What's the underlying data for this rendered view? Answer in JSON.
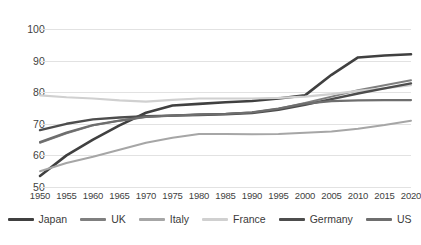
{
  "chart_data": {
    "type": "line",
    "title": "",
    "subtitle": "",
    "xlabel": "",
    "ylabel": "",
    "xlim": [
      1950,
      2020
    ],
    "ylim": [
      50,
      100
    ],
    "yticks": [
      50,
      60,
      70,
      80,
      90,
      100
    ],
    "grid": true,
    "legend_position": "bottom",
    "categories": [
      1950,
      1955,
      1960,
      1965,
      1970,
      1975,
      1980,
      1985,
      1990,
      1995,
      2000,
      2005,
      2010,
      2015,
      2020
    ],
    "xtick_labels": [
      "1950",
      "1955",
      "1960",
      "1965",
      "1970",
      "1975",
      "1980",
      "1985",
      "1990",
      "1995",
      "2000",
      "2005",
      "2010",
      "2015",
      "2020"
    ],
    "ytick_labels": [
      "50",
      "60",
      "70",
      "80",
      "90",
      "100"
    ],
    "series": [
      {
        "name": "Japan",
        "color": "#404040",
        "width": 2.6,
        "values": [
          53.5,
          60.0,
          65.0,
          69.5,
          73.5,
          75.8,
          76.3,
          76.8,
          77.2,
          78.0,
          79.0,
          85.5,
          91.0,
          91.6,
          92.0
        ]
      },
      {
        "name": "UK",
        "color": "#7f7f7f",
        "width": 2.0,
        "values": [
          64.0,
          67.0,
          69.5,
          71.0,
          72.2,
          72.6,
          73.0,
          73.2,
          73.6,
          74.8,
          76.6,
          78.6,
          80.6,
          82.2,
          83.8
        ]
      },
      {
        "name": "Italy",
        "color": "#a6a6a6",
        "width": 2.0,
        "values": [
          55.0,
          57.6,
          59.6,
          61.8,
          64.0,
          65.6,
          66.8,
          66.8,
          66.7,
          66.8,
          67.2,
          67.6,
          68.4,
          69.6,
          71.0
        ]
      },
      {
        "name": "France",
        "color": "#d0d0d0",
        "width": 2.2,
        "values": [
          79.0,
          78.4,
          78.0,
          77.4,
          77.0,
          77.6,
          78.0,
          78.0,
          78.0,
          78.2,
          78.6,
          79.4,
          80.4,
          81.2,
          82.2
        ]
      },
      {
        "name": "Germany",
        "color": "#4d4d4d",
        "width": 2.4,
        "values": [
          68.0,
          70.0,
          71.4,
          72.0,
          72.4,
          72.6,
          72.8,
          73.0,
          73.4,
          74.4,
          76.0,
          77.8,
          79.6,
          81.2,
          82.8
        ]
      },
      {
        "name": "US",
        "color": "#6e6e6e",
        "width": 2.2,
        "values": [
          64.2,
          67.2,
          69.6,
          71.0,
          72.2,
          72.6,
          72.9,
          73.1,
          73.6,
          74.8,
          76.4,
          77.2,
          77.4,
          77.5,
          77.5
        ]
      }
    ]
  }
}
